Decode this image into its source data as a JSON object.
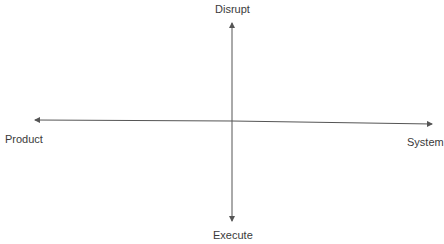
{
  "diagram": {
    "type": "quadrant-axes",
    "axes": {
      "top": "Disrupt",
      "bottom": "Execute",
      "left": "Product",
      "right": "System"
    },
    "colors": {
      "line": "#555555",
      "text": "#3a3a3a"
    }
  }
}
